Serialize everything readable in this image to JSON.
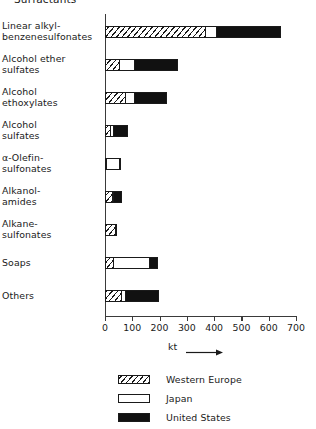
{
  "chart_data": {
    "type": "bar",
    "orientation": "horizontal",
    "stacked": true,
    "title": "Surfactants",
    "xlabel": "kt",
    "ylabel": "",
    "xlim": [
      0,
      700
    ],
    "xticks": [
      0,
      100,
      200,
      300,
      400,
      500,
      600,
      700
    ],
    "xticklabels": [
      "0",
      "100",
      "200",
      "300",
      "400",
      "500",
      "600",
      "700"
    ],
    "grid": false,
    "legend_position": "bottom-center",
    "categories": [
      "Linear alkyl-\nbenzenesulfonates",
      "Alcohol ether\nsulfates",
      "Alcohol\nethoxylates",
      "Alcohol\nsulfates",
      "α-Olefin-\nsulfonates",
      "Alkanol-\namides",
      "Alkane-\nsulfonates",
      "Soaps",
      "Others"
    ],
    "series": [
      {
        "name": "Western Europe",
        "pattern": "hatched",
        "color": "#ffffff",
        "values": [
          365,
          50,
          75,
          20,
          5,
          25,
          35,
          30,
          60
        ]
      },
      {
        "name": "Japan",
        "pattern": "solid-white",
        "color": "#ffffff",
        "values": [
          40,
          55,
          30,
          10,
          45,
          5,
          5,
          130,
          15
        ]
      },
      {
        "name": "United States",
        "pattern": "solid-black",
        "color": "#111111",
        "values": [
          235,
          160,
          120,
          50,
          5,
          30,
          0,
          30,
          120
        ]
      }
    ],
    "totals": [
      640,
      265,
      225,
      80,
      55,
      60,
      40,
      190,
      195
    ]
  },
  "axis": {
    "unit_label": "kt",
    "arrow_icon": "right-arrow-icon"
  },
  "legend": {
    "items": [
      {
        "label": "Western Europe",
        "swatch": "hatched-swatch"
      },
      {
        "label": "Japan",
        "swatch": "white-swatch"
      },
      {
        "label": "United States",
        "swatch": "black-swatch"
      }
    ]
  }
}
